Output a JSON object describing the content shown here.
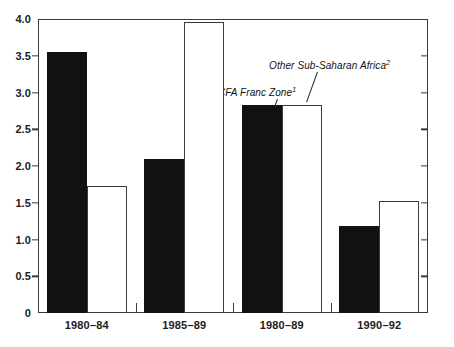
{
  "chart_data": {
    "type": "bar",
    "title": "",
    "xlabel": "",
    "ylabel": "",
    "ylim": [
      0,
      4.0
    ],
    "ytick_labels": [
      "0",
      "0.5",
      "1.0",
      "1.5",
      "2.0",
      "2.5",
      "3.0",
      "3.5",
      "4.0"
    ],
    "ytick_values": [
      0,
      0.5,
      1.0,
      1.5,
      2.0,
      2.5,
      3.0,
      3.5,
      4.0
    ],
    "grid": false,
    "legend_position": "in-plot-annotations",
    "categories": [
      "1980–84",
      "1985–89",
      "1980–89",
      "1990–92"
    ],
    "series": [
      {
        "name": "CFA Franc Zone",
        "footnote": "1",
        "color": "#111111",
        "fill": "solid-black",
        "values": [
          3.55,
          2.1,
          2.83,
          1.18
        ]
      },
      {
        "name": "Other Sub-Saharan Africa",
        "footnote": "2",
        "color": "#ffffff",
        "fill": "white-outline",
        "values": [
          1.73,
          3.96,
          2.83,
          1.52
        ]
      }
    ],
    "annotations": [
      {
        "text": "CFA Franc Zone",
        "footnote": "1"
      },
      {
        "text": "Other Sub-Saharan Africa",
        "footnote": "2"
      }
    ]
  },
  "annotations": {
    "cfa": {
      "text": "CFA Franc Zone",
      "footnote": "1"
    },
    "other": {
      "text": "Other Sub-Saharan Africa",
      "footnote": "2"
    }
  },
  "title_faint": ""
}
